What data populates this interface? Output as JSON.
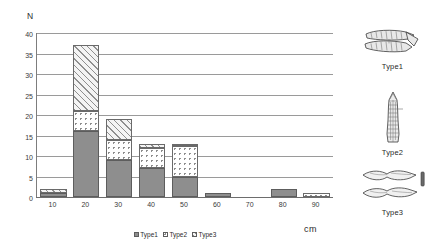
{
  "chart_data": {
    "type": "bar",
    "title": "",
    "subtitle": "",
    "xlabel": "cm",
    "ylabel": "N",
    "stacked": true,
    "grid": true,
    "legend_position": "bottom-center",
    "ylim": [
      0,
      40
    ],
    "ytick_step": 5,
    "yticks": [
      "0",
      "5",
      "10",
      "15",
      "20",
      "25",
      "30",
      "35",
      "40"
    ],
    "categories": [
      "10",
      "20",
      "30",
      "40",
      "50",
      "60",
      "70",
      "80",
      "90"
    ],
    "xticks": [
      "10",
      "20",
      "30",
      "40",
      "50",
      "60",
      "70",
      "80",
      "90"
    ],
    "series": [
      {
        "name": "Type1",
        "values": [
          1,
          16,
          9,
          7,
          5,
          1,
          0,
          2,
          0
        ]
      },
      {
        "name": "Type2",
        "values": [
          0,
          5,
          5,
          5,
          7.5,
          0,
          0,
          0,
          1
        ]
      },
      {
        "name": "Type3",
        "values": [
          1,
          16,
          5,
          1,
          0.5,
          0,
          0,
          0,
          0
        ]
      }
    ],
    "totals": [
      2,
      37,
      19,
      13,
      13,
      1,
      0,
      2,
      1
    ]
  },
  "axes": {
    "y_title": "N",
    "x_unit": "cm"
  },
  "legend": {
    "items": [
      {
        "label": "Type1",
        "pattern": "solid-gray"
      },
      {
        "label": "Type2",
        "pattern": "dotted"
      },
      {
        "label": "Type3",
        "pattern": "diagonal-hatch"
      }
    ]
  },
  "figures": [
    {
      "caption": "Type1",
      "icon": "stone-blade-artifact-icon"
    },
    {
      "caption": "Type2",
      "icon": "stone-point-artifact-icon"
    },
    {
      "caption": "Type3",
      "icon": "stone-flake-artifact-icon"
    }
  ],
  "colors": {
    "type1_fill": "#8e8e8e",
    "type2_fill": "#ffffff",
    "type3_fill": "#f2f2f2",
    "gridline": "#9a9a9a",
    "axis": "#6d6d6d",
    "text": "#2b2b2b"
  }
}
